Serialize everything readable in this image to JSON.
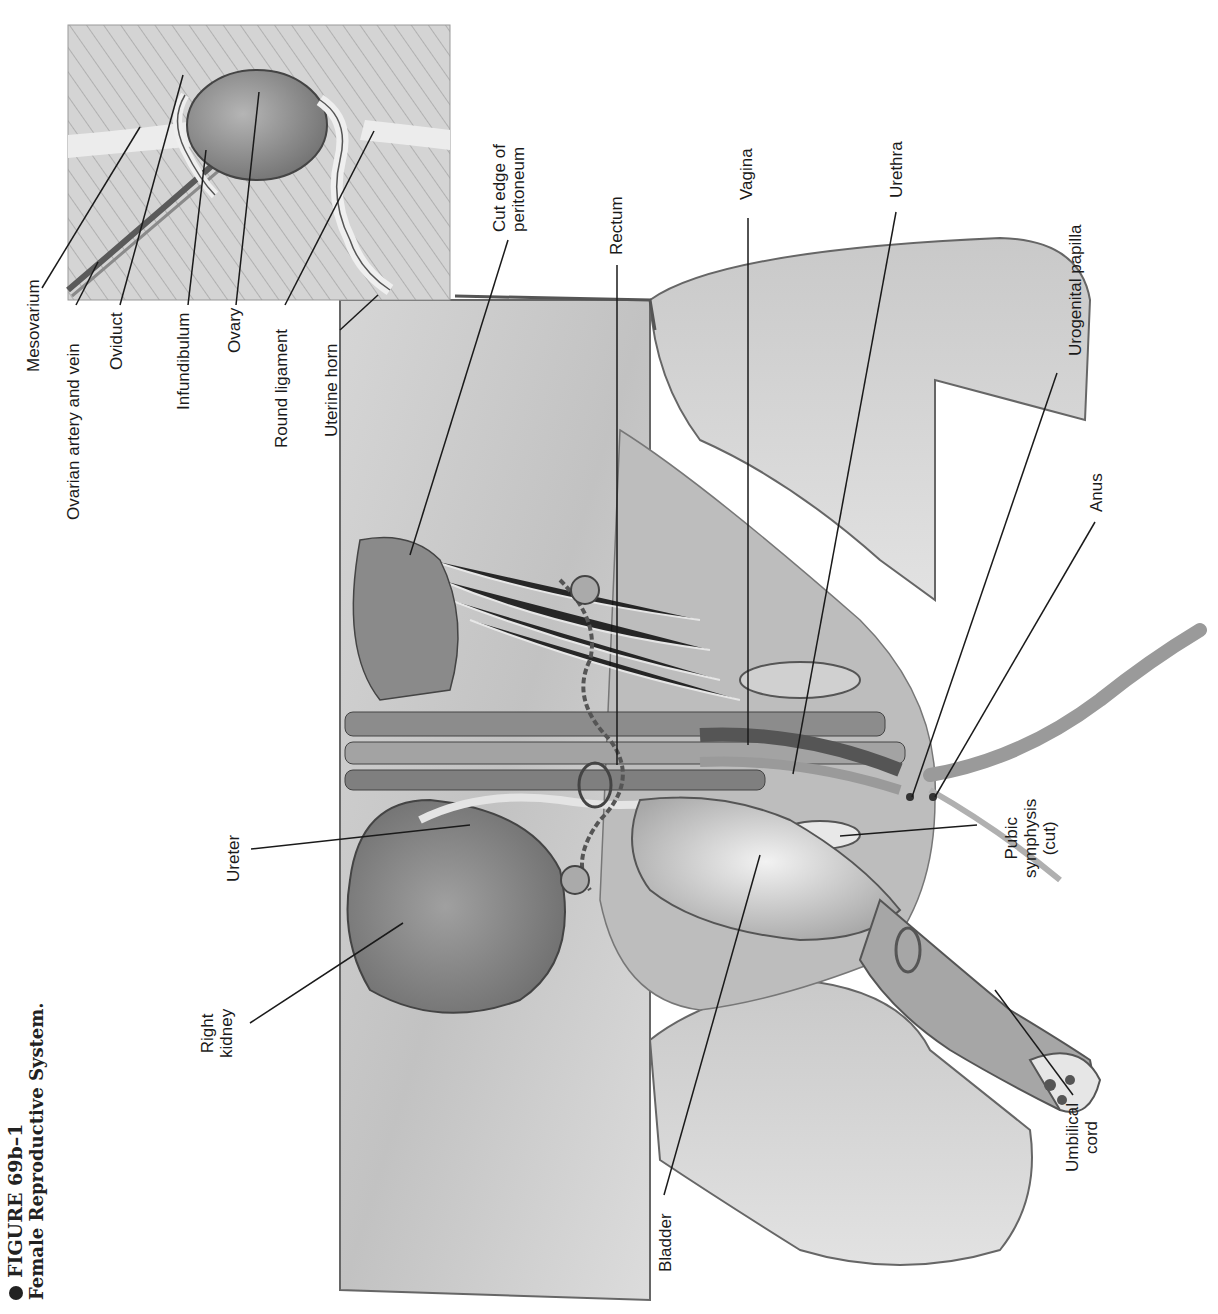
{
  "caption": {
    "figure_number": "FIGURE 69b–1",
    "title": "Female Reproductive System."
  },
  "inset_labels": [
    {
      "id": "mesovarium",
      "text": "Mesovarium"
    },
    {
      "id": "ovarian-artery-vein",
      "text": "Ovarian artery and vein"
    },
    {
      "id": "oviduct",
      "text": "Oviduct"
    },
    {
      "id": "infundibulum",
      "text": "Infundibulum"
    },
    {
      "id": "ovary",
      "text": "Ovary"
    },
    {
      "id": "round-ligament",
      "text": "Round ligament"
    },
    {
      "id": "uterine-horn",
      "text": "Uterine horn"
    }
  ],
  "main_labels": {
    "cut_edge": {
      "line1": "Cut edge of",
      "line2": "peritoneum"
    },
    "rectum": "Rectum",
    "vagina": "Vagina",
    "urethra": "Urethra",
    "urogenital_papilla": "Urogenital papilla",
    "anus": "Anus",
    "pubic_symphysis": {
      "line1": "Pubic",
      "line2": "symphysis",
      "line3": "(cut)"
    },
    "umbilical_cord": {
      "line1": "Umbilical",
      "line2": "cord"
    },
    "bladder": "Bladder",
    "right_kidney": {
      "line1": "Right",
      "line2": "kidney"
    },
    "ureter": "Ureter"
  },
  "colors": {
    "tissue_light": "#e6e6e6",
    "tissue_mid": "#b8b8b8",
    "tissue_dark": "#7a7a7a",
    "outline": "#555555",
    "leader": "#1a1a1a"
  }
}
